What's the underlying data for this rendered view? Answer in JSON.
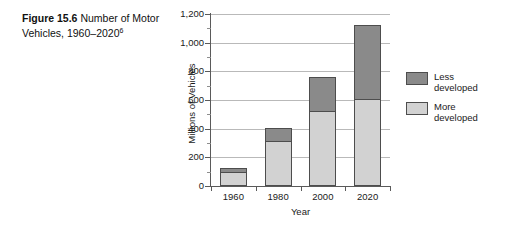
{
  "caption": {
    "figure_label": "Figure 15.6",
    "text": "Number of Motor Vehicles, 1960–2020",
    "footnote_marker": "6"
  },
  "chart_data": {
    "type": "bar",
    "stacked": true,
    "title": "",
    "xlabel": "Year",
    "ylabel": "Millions of Vehicles",
    "categories": [
      "1960",
      "1980",
      "2000",
      "2020"
    ],
    "series": [
      {
        "name": "More developed",
        "color": "#d2d2d2",
        "values": [
          100,
          315,
          525,
          610
        ]
      },
      {
        "name": "Less developed",
        "color": "#8a8a8a",
        "values": [
          25,
          90,
          235,
          515
        ]
      }
    ],
    "totals": [
      125,
      405,
      760,
      1125
    ],
    "ylim": [
      0,
      1200
    ],
    "ytick_labels": [
      "0",
      "200",
      "400",
      "600",
      "800",
      "1,000",
      "1,200"
    ],
    "ytick_values": [
      0,
      200,
      400,
      600,
      800,
      1000,
      1200
    ],
    "yminor_values": [
      100,
      300,
      500,
      700,
      900,
      1100
    ],
    "grid": true,
    "legend_position": "right",
    "legend": [
      {
        "label_line1": "Less",
        "label_line2": "developed",
        "color": "#8a8a8a"
      },
      {
        "label_line1": "More",
        "label_line2": "developed",
        "color": "#d2d2d2"
      }
    ]
  }
}
